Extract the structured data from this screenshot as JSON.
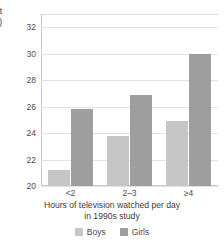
{
  "chart_data": {
    "type": "bar",
    "title": "",
    "subtitle": "",
    "xlabel_lines": [
      "Hours of television watched per day",
      "in 1990s study"
    ],
    "ylabel_clipped_lines": [
      "at",
      "n)"
    ],
    "categories": [
      "<2",
      "2–3",
      "≥4"
    ],
    "series": [
      {
        "name": "Boys",
        "color": "#c6c6c6",
        "values": [
          21.2,
          23.8,
          24.9
        ]
      },
      {
        "name": "Girls",
        "color": "#9e9e9e",
        "values": [
          25.8,
          26.9,
          30.0
        ]
      }
    ],
    "ylim": [
      20,
      33
    ],
    "yticks": [
      20,
      22,
      24,
      26,
      28,
      30,
      32
    ],
    "ytick_labels": [
      "20",
      "22",
      "24",
      "26",
      "28",
      "30",
      "32"
    ],
    "grid": true,
    "grid_axis": "y",
    "legend_position": "bottom",
    "legend_entries": [
      "Boys",
      "Girls"
    ]
  },
  "colors": {
    "boys": "#c6c6c6",
    "girls": "#9e9e9e",
    "grid": "#e2e2e2",
    "axis": "#c9c9c9",
    "text": "#3a3a3a",
    "background": "#ffffff"
  }
}
